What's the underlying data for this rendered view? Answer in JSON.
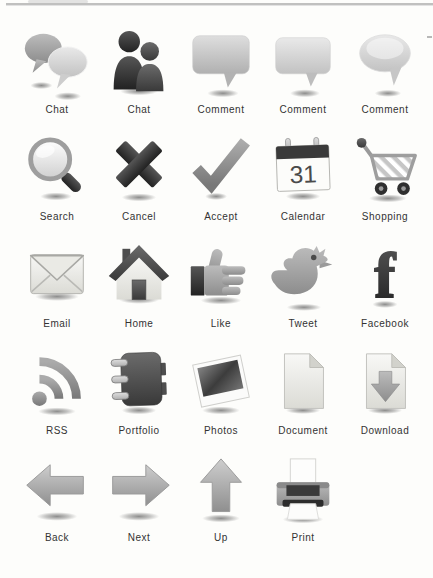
{
  "page": {
    "kind": "icon reference sheet",
    "background": "#fdfdfb",
    "label_text_color": "#333333",
    "icon_colors": {
      "dark": "#2e2e2e",
      "mid_gray": "#8e8e8e",
      "light_gray": "#cfcfcf",
      "page_white": "#f6f6f3"
    }
  },
  "calendar": {
    "day": "31"
  },
  "facebook": {
    "glyph": "f"
  },
  "grid": {
    "items": [
      {
        "label": "Chat",
        "icon": "chat-bubbles-icon"
      },
      {
        "label": "Chat",
        "icon": "chat-people-icon"
      },
      {
        "label": "Comment",
        "icon": "comment-bubble-square-icon"
      },
      {
        "label": "Comment",
        "icon": "comment-bubble-square-alt-icon"
      },
      {
        "label": "Comment",
        "icon": "comment-bubble-round-icon"
      },
      {
        "label": "Search",
        "icon": "magnifier-icon"
      },
      {
        "label": "Cancel",
        "icon": "x-icon"
      },
      {
        "label": "Accept",
        "icon": "checkmark-icon"
      },
      {
        "label": "Calendar",
        "icon": "calendar-icon"
      },
      {
        "label": "Shopping",
        "icon": "shopping-cart-icon"
      },
      {
        "label": "Email",
        "icon": "envelope-icon"
      },
      {
        "label": "Home",
        "icon": "house-icon"
      },
      {
        "label": "Like",
        "icon": "thumbs-up-icon"
      },
      {
        "label": "Tweet",
        "icon": "twitter-bird-icon"
      },
      {
        "label": "Facebook",
        "icon": "facebook-f-icon"
      },
      {
        "label": "RSS",
        "icon": "rss-icon"
      },
      {
        "label": "Portfolio",
        "icon": "binder-icon"
      },
      {
        "label": "Photos",
        "icon": "photo-icon"
      },
      {
        "label": "Document",
        "icon": "document-icon"
      },
      {
        "label": "Download",
        "icon": "download-icon"
      },
      {
        "label": "Back",
        "icon": "arrow-left-icon"
      },
      {
        "label": "Next",
        "icon": "arrow-right-icon"
      },
      {
        "label": "Up",
        "icon": "arrow-up-icon"
      },
      {
        "label": "Print",
        "icon": "printer-icon"
      }
    ]
  }
}
